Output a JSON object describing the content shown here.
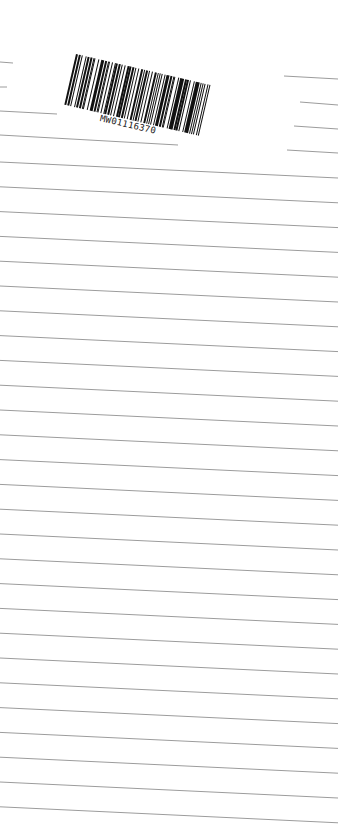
{
  "document": {
    "type": "ruled-notepad-page-scan",
    "background_color": "#ffffff",
    "line_color": "#9c9c9c",
    "barcode": {
      "label": "MW01116370",
      "bar_color": "#111111",
      "rotation_deg": 13
    },
    "ruled_lines": {
      "count": 27,
      "left_x": 0,
      "right_x": 338,
      "first_left_y": 162,
      "first_right_y": 178,
      "spacing": 24.8
    },
    "partial_lines": [
      {
        "x1": 0,
        "y1": 62,
        "x2": 13,
        "y2": 63
      },
      {
        "x1": 0,
        "y1": 87,
        "x2": 7,
        "y2": 87
      },
      {
        "x1": 0,
        "y1": 111,
        "x2": 57,
        "y2": 114
      },
      {
        "x1": 0,
        "y1": 135,
        "x2": 178,
        "y2": 145
      },
      {
        "x1": 284,
        "y1": 76,
        "x2": 338,
        "y2": 79
      },
      {
        "x1": 300,
        "y1": 102,
        "x2": 338,
        "y2": 105
      },
      {
        "x1": 294,
        "y1": 126,
        "x2": 338,
        "y2": 129
      },
      {
        "x1": 287,
        "y1": 150,
        "x2": 338,
        "y2": 153
      }
    ]
  }
}
